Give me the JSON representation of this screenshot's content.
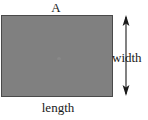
{
  "diagram": {
    "type": "geometry-rectangle-dimensions",
    "canvas": {
      "width": 148,
      "height": 120,
      "background_color": "#ffffff"
    },
    "labels": {
      "area": "A",
      "width": "width",
      "length": "length"
    },
    "shape": {
      "name": "rectangle",
      "fill_color": "#808080",
      "stroke_color": "#4a4a4a",
      "x": 1,
      "y": 15,
      "width": 112,
      "height": 82
    },
    "annotations": [
      {
        "name": "width-dimension-arrow",
        "icon": "double-headed-vertical-arrow",
        "orientation": "vertical",
        "color": "#1a1a1a",
        "measures": "width"
      }
    ],
    "text_color": "#1a1a1a"
  }
}
